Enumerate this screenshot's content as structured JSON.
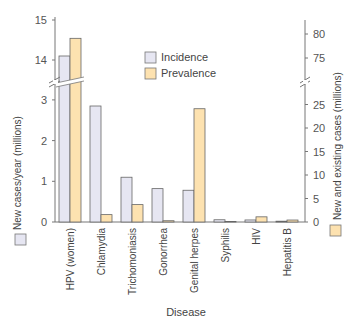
{
  "chart_data": {
    "type": "bar",
    "title": "",
    "xlabel": "Disease",
    "ylabel_left": "New cases/year (millions)",
    "ylabel_right": "New and existing cases (millions)",
    "categories": [
      "HPV (women)",
      "Chlamydia",
      "Trichomoniasis",
      "Gonorrhea",
      "Genital herpes",
      "Syphilis",
      "HIV",
      "Hepatitis B"
    ],
    "series": [
      {
        "name": "Incidence",
        "axis": "left",
        "color": "#e6e6f2",
        "values": [
          14.1,
          2.85,
          1.1,
          0.82,
          0.78,
          0.055,
          0.05,
          0.02
        ]
      },
      {
        "name": "Prevalence",
        "axis": "right",
        "color": "#fde2b0",
        "values": [
          79.1,
          1.57,
          3.7,
          0.27,
          24.1,
          0.12,
          1.1,
          0.42
        ]
      }
    ],
    "left_axis": {
      "ticks_lower": [
        0,
        1,
        2,
        3
      ],
      "ticks_upper": [
        14,
        15
      ],
      "break_between": [
        3.4,
        13.7
      ],
      "ylim": [
        0,
        15
      ]
    },
    "right_axis": {
      "ticks_lower": [
        0,
        5,
        10,
        15,
        20,
        25
      ],
      "ticks_upper": [
        75,
        80
      ],
      "break_between": [
        29,
        71
      ],
      "ylim": [
        0,
        82
      ]
    },
    "legend": {
      "entries": [
        "Incidence",
        "Prevalence"
      ],
      "position": "upper center"
    },
    "grid": false
  },
  "labels": {
    "xlabel": "Disease",
    "ylabel_left": "New cases/year (millions)",
    "ylabel_right": "New and existing cases (millions)",
    "legend_incidence": "Incidence",
    "legend_prevalence": "Prevalence"
  }
}
